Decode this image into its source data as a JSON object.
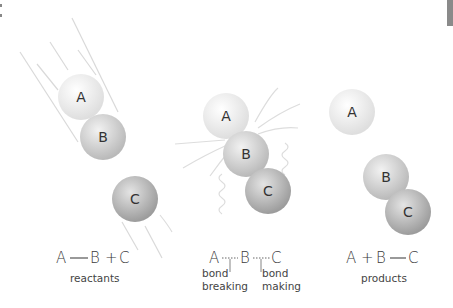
{
  "diagram": {
    "colors": {
      "atom_a": "#eeeeee",
      "atom_b": "#cfcfcf",
      "atom_c": "#b4b4b4",
      "motion_lines": "#d8d8d8",
      "text": "#3a3a3a",
      "edge_bar": "#777777"
    },
    "panels": [
      {
        "id": "reactants",
        "atoms": [
          {
            "label": "A",
            "cx": 81,
            "cy": 97
          },
          {
            "label": "B",
            "cx": 103,
            "cy": 137
          },
          {
            "label": "C",
            "cx": 135,
            "cy": 199
          }
        ],
        "equation": {
          "a": "A",
          "b": "B",
          "plus": "+",
          "c": "C"
        },
        "caption": "reactants"
      },
      {
        "id": "transition",
        "atoms": [
          {
            "label": "A",
            "cx": 226,
            "cy": 116
          },
          {
            "label": "B",
            "cx": 246,
            "cy": 154
          },
          {
            "label": "C",
            "cx": 268,
            "cy": 191
          }
        ],
        "equation": {
          "a": "A",
          "b": "B",
          "c": "C"
        },
        "bond_breaking": {
          "line1": "bond",
          "line2": "breaking"
        },
        "bond_making": {
          "line1": "bond",
          "line2": "making"
        }
      },
      {
        "id": "products",
        "atoms": [
          {
            "label": "A",
            "cx": 352,
            "cy": 112
          },
          {
            "label": "B",
            "cx": 386,
            "cy": 177
          },
          {
            "label": "C",
            "cx": 408,
            "cy": 212
          }
        ],
        "equation": {
          "a": "A",
          "plus": "+",
          "b": "B",
          "c": "C"
        },
        "caption": "products"
      }
    ]
  }
}
